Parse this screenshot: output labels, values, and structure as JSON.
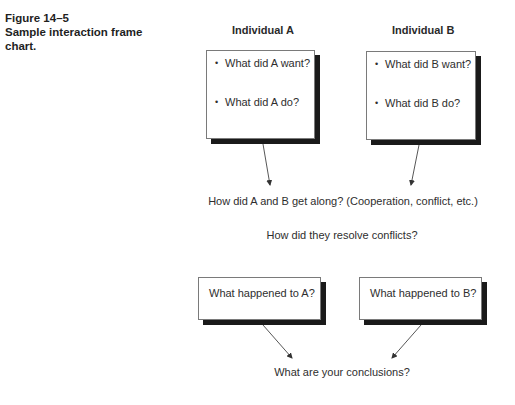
{
  "caption": {
    "figure_number": "Figure 14–5",
    "title_line1": "Sample interaction frame",
    "title_line2": "chart."
  },
  "individuals": [
    {
      "heading": "Individual A",
      "questions": [
        "What did A want?",
        "What did A do?"
      ],
      "outcome": "What happened to A?"
    },
    {
      "heading": "Individual B",
      "questions": [
        "What did B want?",
        "What did B do?"
      ],
      "outcome": "What happened to B?"
    }
  ],
  "bullet_glyph": "•",
  "interaction_question": "How did A and B get along? (Cooperation, conflict, etc.)",
  "resolution_question": "How did they resolve conflicts?",
  "conclusion_question": "What are your conclusions?"
}
